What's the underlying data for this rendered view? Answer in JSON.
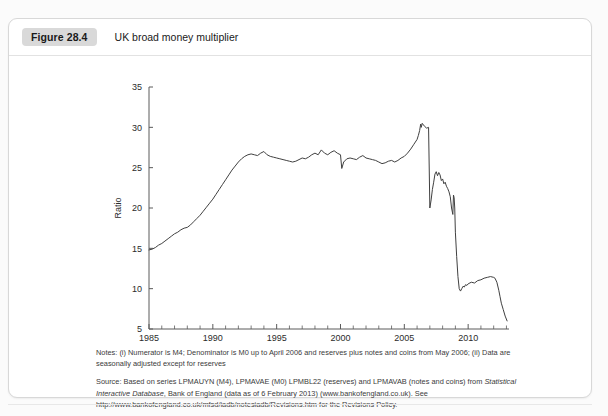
{
  "header": {
    "figure_label": "Figure 28.4",
    "title": "UK broad money multiplier"
  },
  "notes": {
    "notes_text": "Notes: (i) Numerator is M4; Denominator is M0 up to April 2006 and reserves plus notes and coins from May 2006; (ii) Data are seasonally adjusted except for reserves",
    "source_line1_pre": "Source: Based on series LPMAUYN (M4), LPMAVAE (M0) LPMBL22 (reserves) and LPMAVAB (notes and coins) from ",
    "source_line1_italic": "Statistical Interactive Database",
    "source_line1_post": ", Bank of England (data as of 6 February 2013) (www.bankofengland.co.uk).",
    "source_line2": "See http://www.bankofengland.co.uk/mfsd/iadb/notesiadb/Revisions.htm for the Revisions Policy."
  },
  "colors": {
    "line": "#404040",
    "axis": "#5a5a5a",
    "badge_bg": "#d9d9d9",
    "card_border": "#d8d8d8"
  },
  "chart_data": {
    "type": "line",
    "title": "UK broad money multiplier",
    "xlabel": "",
    "ylabel": "Ratio",
    "xlim": [
      1985,
      2013.2
    ],
    "ylim": [
      5,
      35
    ],
    "ytick_step": 5,
    "yticks": [
      5,
      10,
      15,
      20,
      25,
      30,
      35
    ],
    "xticks_major": [
      1985,
      1990,
      1995,
      2000,
      2005,
      2010
    ],
    "xtick_labels": [
      "1985",
      "1990",
      "1995",
      "2000",
      "2005",
      "2010"
    ],
    "xtick_minor_step": 1,
    "grid": false,
    "legend": null,
    "series": [
      {
        "name": "UK broad money multiplier",
        "x": [
          1985.0,
          1985.25,
          1985.5,
          1985.75,
          1986.0,
          1986.25,
          1986.5,
          1986.75,
          1987.0,
          1987.25,
          1987.5,
          1987.75,
          1988.0,
          1988.25,
          1988.5,
          1988.75,
          1989.0,
          1989.25,
          1989.5,
          1989.75,
          1990.0,
          1990.25,
          1990.5,
          1990.75,
          1991.0,
          1991.25,
          1991.5,
          1991.75,
          1992.0,
          1992.25,
          1992.5,
          1992.75,
          1993.0,
          1993.25,
          1993.5,
          1993.75,
          1994.0,
          1994.25,
          1994.5,
          1994.75,
          1995.0,
          1995.25,
          1995.5,
          1995.75,
          1996.0,
          1996.25,
          1996.5,
          1996.75,
          1997.0,
          1997.25,
          1997.5,
          1997.75,
          1998.0,
          1998.25,
          1998.5,
          1998.75,
          1999.0,
          1999.25,
          1999.5,
          1999.75,
          2000.0,
          2000.1,
          2000.25,
          2000.5,
          2000.75,
          2001.0,
          2001.25,
          2001.5,
          2001.75,
          2002.0,
          2002.25,
          2002.5,
          2002.75,
          2003.0,
          2003.25,
          2003.5,
          2003.75,
          2004.0,
          2004.25,
          2004.5,
          2004.75,
          2005.0,
          2005.25,
          2005.5,
          2005.75,
          2006.0,
          2006.1,
          2006.2,
          2006.28,
          2006.33,
          2006.4,
          2006.5,
          2006.6,
          2006.75,
          2006.9,
          2007.0,
          2007.1,
          2007.2,
          2007.3,
          2007.4,
          2007.5,
          2007.6,
          2007.7,
          2007.8,
          2007.9,
          2008.0,
          2008.1,
          2008.2,
          2008.3,
          2008.4,
          2008.5,
          2008.6,
          2008.7,
          2008.8,
          2008.85,
          2008.9,
          2008.95,
          2009.0,
          2009.1,
          2009.2,
          2009.3,
          2009.4,
          2009.5,
          2009.6,
          2009.7,
          2009.8,
          2009.9,
          2010.0,
          2010.25,
          2010.5,
          2010.75,
          2011.0,
          2011.25,
          2011.5,
          2011.75,
          2012.0,
          2012.1,
          2012.25,
          2012.4,
          2012.5,
          2012.6,
          2012.75,
          2012.9,
          2013.05
        ],
        "y": [
          14.8,
          14.9,
          15.1,
          15.4,
          15.6,
          15.9,
          16.2,
          16.5,
          16.8,
          17.0,
          17.3,
          17.5,
          17.6,
          17.9,
          18.3,
          18.7,
          19.1,
          19.6,
          20.1,
          20.6,
          21.1,
          21.7,
          22.3,
          22.9,
          23.5,
          24.1,
          24.7,
          25.2,
          25.7,
          26.1,
          26.4,
          26.6,
          26.7,
          26.6,
          26.5,
          26.8,
          27.0,
          26.6,
          26.4,
          26.3,
          26.2,
          26.1,
          26.0,
          25.9,
          25.8,
          25.7,
          25.8,
          26.0,
          26.2,
          26.1,
          26.3,
          26.6,
          26.8,
          26.6,
          27.2,
          26.8,
          26.6,
          26.9,
          27.1,
          26.8,
          26.6,
          24.9,
          25.7,
          26.1,
          26.2,
          26.1,
          26.0,
          26.3,
          26.5,
          26.2,
          26.1,
          26.0,
          25.9,
          25.7,
          25.5,
          25.6,
          25.8,
          25.9,
          25.7,
          25.9,
          26.2,
          26.4,
          26.8,
          27.3,
          27.9,
          28.5,
          29.0,
          29.6,
          30.4,
          30.0,
          30.5,
          30.3,
          30.1,
          29.9,
          30.0,
          20.0,
          21.0,
          22.3,
          23.2,
          24.2,
          24.5,
          24.0,
          24.4,
          24.1,
          23.4,
          23.6,
          23.0,
          23.2,
          22.7,
          22.4,
          22.0,
          21.4,
          20.0,
          19.2,
          21.6,
          21.3,
          20.0,
          17.0,
          14.0,
          11.5,
          10.0,
          9.7,
          10.0,
          10.3,
          10.2,
          10.5,
          10.4,
          10.6,
          10.8,
          10.7,
          11.0,
          11.1,
          11.3,
          11.4,
          11.5,
          11.4,
          11.3,
          10.8,
          9.8,
          9.0,
          8.2,
          7.4,
          6.6,
          6.0
        ]
      }
    ]
  }
}
